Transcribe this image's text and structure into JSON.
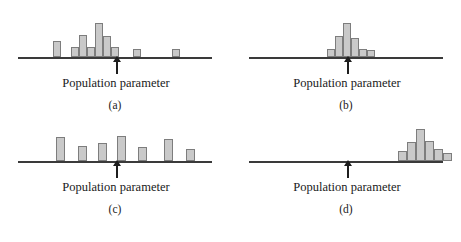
{
  "figure": {
    "background_color": "#ffffff",
    "bar_fill_color": "#c9c9c9",
    "bar_border_color": "#7d7d7d",
    "axis_color": "#3a3a3a",
    "arrow_color": "#1e1e1e",
    "text_color": "#1a1a1a"
  },
  "common": {
    "parameter_label": "Population parameter"
  },
  "chart_data": [
    {
      "type": "bar",
      "panel": "a",
      "caption": "(a)",
      "title": "",
      "xlabel": "Population parameter",
      "ylabel": "",
      "description": "High bias and high variability: values scattered widely and centered left of the population parameter",
      "grid": false,
      "legend": null,
      "axis_y_px": 57,
      "parameter_marker_x_px": 116,
      "xlim": [
        18,
        212
      ],
      "ylim": [
        0,
        40
      ],
      "bar_width_px": 8,
      "bars": [
        {
          "x_px": 53,
          "height_px": 16
        },
        {
          "x_px": 71,
          "height_px": 10
        },
        {
          "x_px": 79,
          "height_px": 22
        },
        {
          "x_px": 87,
          "height_px": 10
        },
        {
          "x_px": 95,
          "height_px": 34
        },
        {
          "x_px": 103,
          "height_px": 21
        },
        {
          "x_px": 111,
          "height_px": 10
        },
        {
          "x_px": 133,
          "height_px": 8
        },
        {
          "x_px": 172,
          "height_px": 8
        }
      ]
    },
    {
      "type": "bar",
      "panel": "b",
      "caption": "(b)",
      "title": "",
      "xlabel": "Population parameter",
      "ylabel": "",
      "description": "Low bias and low variability: tight cluster centered on the population parameter",
      "grid": false,
      "legend": null,
      "axis_y_px": 57,
      "parameter_marker_x_px": 116,
      "xlim": [
        18,
        212
      ],
      "ylim": [
        0,
        40
      ],
      "bar_width_px": 8,
      "bars": [
        {
          "x_px": 96,
          "height_px": 8
        },
        {
          "x_px": 104,
          "height_px": 21
        },
        {
          "x_px": 112,
          "height_px": 34
        },
        {
          "x_px": 120,
          "height_px": 19
        },
        {
          "x_px": 128,
          "height_px": 8
        },
        {
          "x_px": 136,
          "height_px": 7
        }
      ]
    },
    {
      "type": "bar",
      "panel": "c",
      "caption": "(c)",
      "title": "",
      "xlabel": "Population parameter",
      "ylabel": "",
      "description": "Low bias and high variability: values spread widely but centered on the population parameter",
      "grid": false,
      "legend": null,
      "axis_y_px": 40,
      "parameter_marker_x_px": 116,
      "xlim": [
        18,
        212
      ],
      "ylim": [
        0,
        40
      ],
      "bar_width_px": 9,
      "bars": [
        {
          "x_px": 56,
          "height_px": 24
        },
        {
          "x_px": 78,
          "height_px": 15
        },
        {
          "x_px": 98,
          "height_px": 18
        },
        {
          "x_px": 117,
          "height_px": 25
        },
        {
          "x_px": 138,
          "height_px": 14
        },
        {
          "x_px": 164,
          "height_px": 22
        },
        {
          "x_px": 186,
          "height_px": 12
        }
      ]
    },
    {
      "type": "bar",
      "panel": "d",
      "caption": "(d)",
      "title": "",
      "xlabel": "Population parameter",
      "ylabel": "",
      "description": "High bias and low variability: tight cluster centered well to the right of the population parameter",
      "grid": false,
      "legend": null,
      "axis_y_px": 40,
      "parameter_marker_x_px": 116,
      "xlim": [
        18,
        212
      ],
      "ylim": [
        0,
        40
      ],
      "bar_width_px": 9,
      "bars": [
        {
          "x_px": 167,
          "height_px": 10
        },
        {
          "x_px": 176,
          "height_px": 19
        },
        {
          "x_px": 185,
          "height_px": 32
        },
        {
          "x_px": 194,
          "height_px": 20
        },
        {
          "x_px": 203,
          "height_px": 12
        },
        {
          "x_px": 212,
          "height_px": 8
        }
      ]
    }
  ]
}
